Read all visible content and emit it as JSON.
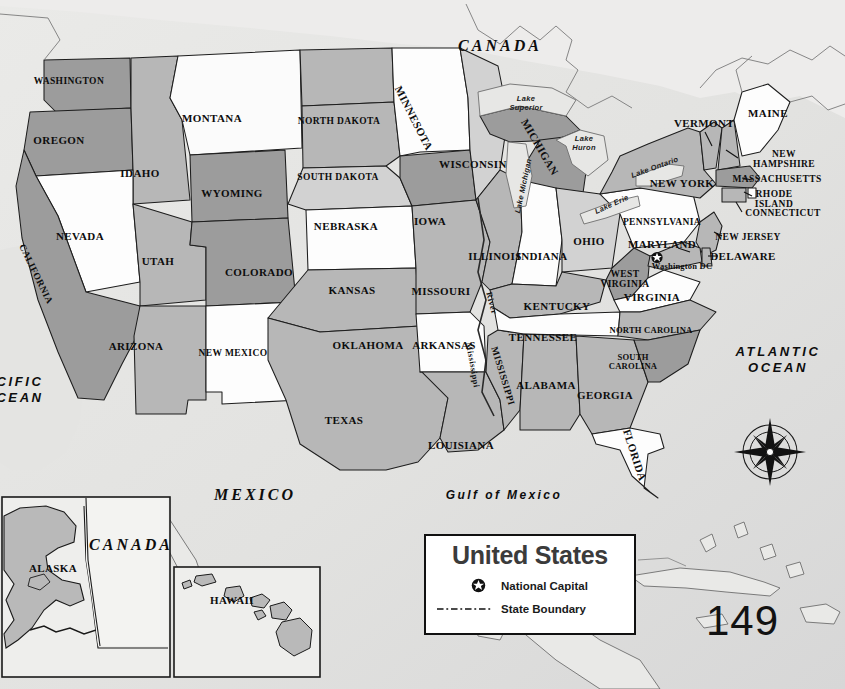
{
  "page": {
    "page_number": "149",
    "accent_colors": {
      "background": "#e6e6e4",
      "state_dark": "#9a9a9a",
      "state_mid": "#b5b5b5",
      "state_light": "#d6d6d6",
      "state_white": "#fdfdfd",
      "water": "#ebebeb",
      "outline": "#1a1a1a"
    }
  },
  "legend": {
    "title": "United States",
    "items": [
      {
        "key": "national-capital-star",
        "label": "National Capital"
      },
      {
        "key": "state-boundary-dash",
        "label": "State Boundary"
      }
    ]
  },
  "compass": {
    "north": "N",
    "east": "E",
    "south": "S",
    "west": "W"
  },
  "countries": [
    {
      "name": "CANADA",
      "x": 500,
      "y": 46
    },
    {
      "name": "MEXICO",
      "x": 255,
      "y": 495
    },
    {
      "name": "CANADA",
      "x": 131,
      "y": 545
    }
  ],
  "oceans": [
    {
      "name": "ATLANTIC\nOCEAN",
      "line1": "ATLANTIC",
      "line2": "OCEAN",
      "x": 778,
      "y": 360
    },
    {
      "name": "PACIFIC OCEAN",
      "line1": "CIFIC",
      "line2": "CEAN",
      "x": 20,
      "y": 390
    }
  ],
  "seas": [
    {
      "name": "Gulf of Mexico",
      "x": 504,
      "y": 495
    }
  ],
  "lakes": [
    {
      "name": "Lake\nSuperior",
      "line1": "Lake",
      "line2": "Superior",
      "x": 526,
      "y": 104
    },
    {
      "name": "Lake\nHuron",
      "line1": "Lake",
      "line2": "Huron",
      "x": 584,
      "y": 144
    },
    {
      "name": "Lake Michigan",
      "x": 524,
      "y": 186,
      "rotate": -78
    },
    {
      "name": "Lake Erie",
      "x": 612,
      "y": 205,
      "rotate": -24
    },
    {
      "name": "Lake Ontario",
      "x": 655,
      "y": 168,
      "rotate": -20
    }
  ],
  "rivers": [
    {
      "name": "Mississippi",
      "x": 473,
      "y": 365,
      "rotate": 80
    },
    {
      "name": "River",
      "x": 492,
      "y": 303,
      "rotate": 75
    }
  ],
  "capital": {
    "name": "Washington DC",
    "x": 682,
    "y": 266,
    "marker_x": 657,
    "marker_y": 259
  },
  "states": [
    {
      "name": "WASHINGTON",
      "x": 69,
      "y": 81,
      "shade": "dark"
    },
    {
      "name": "OREGON",
      "x": 59,
      "y": 140,
      "shade": "dark"
    },
    {
      "name": "IDAHO",
      "x": 140,
      "y": 173,
      "shade": "mid"
    },
    {
      "name": "MONTANA",
      "x": 212,
      "y": 118,
      "shade": "white"
    },
    {
      "name": "WYOMING",
      "x": 232,
      "y": 193,
      "shade": "dark"
    },
    {
      "name": "NEVADA",
      "x": 80,
      "y": 236,
      "shade": "white"
    },
    {
      "name": "UTAH",
      "x": 158,
      "y": 261,
      "shade": "mid"
    },
    {
      "name": "COLORADO",
      "x": 259,
      "y": 272,
      "shade": "dark"
    },
    {
      "name": "CALIFORNIA",
      "x": 36,
      "y": 274,
      "shade": "dark",
      "rotate": 64
    },
    {
      "name": "ARIZONA",
      "x": 136,
      "y": 346,
      "shade": "mid"
    },
    {
      "name": "NEW MEXICO",
      "x": 233,
      "y": 353,
      "shade": "white"
    },
    {
      "name": "NORTH DAKOTA",
      "x": 339,
      "y": 121,
      "shade": "mid"
    },
    {
      "name": "SOUTH DAKOTA",
      "x": 338,
      "y": 177,
      "shade": "mid"
    },
    {
      "name": "NEBRASKA",
      "x": 346,
      "y": 226,
      "shade": "light"
    },
    {
      "name": "KANSAS",
      "x": 352,
      "y": 290,
      "shade": "white"
    },
    {
      "name": "OKLAHOMA",
      "x": 368,
      "y": 345,
      "shade": "mid"
    },
    {
      "name": "TEXAS",
      "x": 344,
      "y": 420,
      "shade": "mid"
    },
    {
      "name": "MINNESOTA",
      "x": 414,
      "y": 118,
      "shade": "white",
      "rotate": 63
    },
    {
      "name": "IOWA",
      "x": 430,
      "y": 221,
      "shade": "dark"
    },
    {
      "name": "MISSOURI",
      "x": 441,
      "y": 291,
      "shade": "mid"
    },
    {
      "name": "ARKANSAS",
      "x": 444,
      "y": 345,
      "shade": "white"
    },
    {
      "name": "LOUISIANA",
      "x": 461,
      "y": 445,
      "shade": "mid"
    },
    {
      "name": "WISCONSIN",
      "x": 473,
      "y": 164,
      "shade": "light"
    },
    {
      "name": "ILLINOIS",
      "x": 495,
      "y": 256,
      "shade": "mid"
    },
    {
      "name": "MISSISSIPPI",
      "x": 503,
      "y": 376,
      "shade": "mid",
      "rotate": 73
    },
    {
      "name": "MICHIGAN",
      "x": 540,
      "y": 147,
      "shade": "dark",
      "rotate": 60
    },
    {
      "name": "INDIANA",
      "x": 542,
      "y": 256,
      "shade": "white"
    },
    {
      "name": "KENTUCKY",
      "x": 557,
      "y": 306,
      "shade": "mid"
    },
    {
      "name": "TENNESSEE",
      "x": 543,
      "y": 337,
      "shade": "white"
    },
    {
      "name": "ALABAMA",
      "x": 546,
      "y": 385,
      "shade": "mid"
    },
    {
      "name": "OHIO",
      "x": 589,
      "y": 241,
      "shade": "light"
    },
    {
      "name": "GEORGIA",
      "x": 605,
      "y": 395,
      "shade": "mid"
    },
    {
      "name": "FLORIDA",
      "x": 635,
      "y": 455,
      "shade": "white",
      "rotate": 72
    },
    {
      "name": "WEST\nVIRGINIA",
      "line1": "WEST",
      "line2": "VIRGINIA",
      "x": 625,
      "y": 279,
      "shade": "dark"
    },
    {
      "name": "VIRGINIA",
      "x": 652,
      "y": 297,
      "shade": "white"
    },
    {
      "name": "NORTH CAROLINA",
      "x": 651,
      "y": 330,
      "shade": "mid"
    },
    {
      "name": "SOUTH\nCAROLINA",
      "line1": "SOUTH",
      "line2": "CAROLINA",
      "x": 633,
      "y": 362,
      "shade": "dark"
    },
    {
      "name": "PENNSYLVANIA",
      "x": 662,
      "y": 222,
      "shade": "white"
    },
    {
      "name": "NEW YORK",
      "x": 682,
      "y": 183,
      "shade": "mid"
    },
    {
      "name": "VERMONT",
      "x": 704,
      "y": 123,
      "shade": "mid"
    },
    {
      "name": "MAINE",
      "x": 768,
      "y": 113,
      "shade": "white"
    },
    {
      "name": "NEW\nHAMPSHIRE",
      "line1": "NEW",
      "line2": "HAMPSHIRE",
      "x": 784,
      "y": 159,
      "shade": "mid"
    },
    {
      "name": "MASSACHUSETTS",
      "x": 777,
      "y": 179,
      "shade": "mid"
    },
    {
      "name": "RHODE\nISLAND",
      "line1": "RHODE",
      "line2": "ISLAND",
      "x": 774,
      "y": 199,
      "shade": "white"
    },
    {
      "name": "CONNECTICUT",
      "x": 783,
      "y": 213,
      "shade": "mid"
    },
    {
      "name": "NEW JERSEY",
      "x": 748,
      "y": 237,
      "shade": "mid"
    },
    {
      "name": "MARYLAND",
      "x": 662,
      "y": 244,
      "shade": "mid"
    },
    {
      "name": "DELAWARE",
      "x": 743,
      "y": 256,
      "shade": "mid"
    }
  ],
  "insets": [
    {
      "name": "ALASKA",
      "label_x": 53,
      "label_y": 568,
      "box_x": 2,
      "box_y": 497,
      "box_w": 168,
      "box_h": 180
    },
    {
      "name": "HAWAII",
      "label_x": 232,
      "label_y": 600,
      "box_x": 174,
      "box_y": 567,
      "box_w": 146,
      "box_h": 110
    }
  ]
}
